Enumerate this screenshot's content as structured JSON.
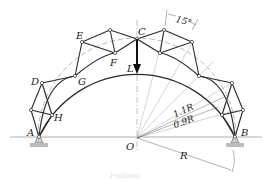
{
  "figure": {
    "node_labels": {
      "A": "A",
      "B": "B",
      "C": "C",
      "D": "D",
      "E": "E",
      "F": "F",
      "G": "G",
      "H": "H",
      "O": "O"
    },
    "load_label": "L",
    "angle_label": "15°",
    "outer_radius_label": "1.1R",
    "inner_radius_label": "0.9R",
    "radius_label": "R",
    "caption": "Problem"
  },
  "colors": {
    "ink": "#2a2a2a",
    "light_line": "#999999",
    "support_fill": "#bbbbbb"
  }
}
